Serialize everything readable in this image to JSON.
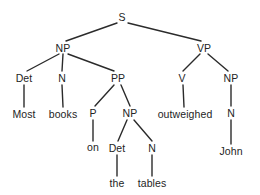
{
  "diagram": {
    "type": "constituency-parse-tree",
    "sentence": "Most books on the tables outweighed John",
    "colors": {
      "background": "#ffffff",
      "edge": "#2b2b2b",
      "text": "#242424"
    },
    "nodes": [
      {
        "id": "s",
        "label": "S",
        "kind": "nonterminal",
        "x": 122,
        "y": 17
      },
      {
        "id": "np1",
        "label": "NP",
        "kind": "nonterminal",
        "x": 63,
        "y": 48
      },
      {
        "id": "vp",
        "label": "VP",
        "kind": "nonterminal",
        "x": 204,
        "y": 48
      },
      {
        "id": "det1",
        "label": "Det",
        "kind": "nonterminal",
        "x": 24,
        "y": 78
      },
      {
        "id": "n1",
        "label": "N",
        "kind": "nonterminal",
        "x": 62,
        "y": 78
      },
      {
        "id": "pp",
        "label": "PP",
        "kind": "nonterminal",
        "x": 118,
        "y": 78
      },
      {
        "id": "v",
        "label": "V",
        "kind": "nonterminal",
        "x": 182,
        "y": 78
      },
      {
        "id": "np3",
        "label": "NP",
        "kind": "nonterminal",
        "x": 231,
        "y": 78
      },
      {
        "id": "w-most",
        "label": "Most",
        "kind": "terminal",
        "x": 24,
        "y": 114
      },
      {
        "id": "w-books",
        "label": "books",
        "kind": "terminal",
        "x": 63,
        "y": 114
      },
      {
        "id": "p",
        "label": "P",
        "kind": "nonterminal",
        "x": 93,
        "y": 113
      },
      {
        "id": "np2",
        "label": "NP",
        "kind": "nonterminal",
        "x": 130,
        "y": 113
      },
      {
        "id": "w-outweighed",
        "label": "outweighed",
        "kind": "terminal",
        "x": 185,
        "y": 114
      },
      {
        "id": "n3",
        "label": "N",
        "kind": "nonterminal",
        "x": 231,
        "y": 113
      },
      {
        "id": "w-on",
        "label": "on",
        "kind": "terminal",
        "x": 93,
        "y": 147
      },
      {
        "id": "det2",
        "label": "Det",
        "kind": "nonterminal",
        "x": 117,
        "y": 148
      },
      {
        "id": "n2",
        "label": "N",
        "kind": "nonterminal",
        "x": 152,
        "y": 148
      },
      {
        "id": "w-john",
        "label": "John",
        "kind": "terminal",
        "x": 231,
        "y": 151
      },
      {
        "id": "w-the",
        "label": "the",
        "kind": "terminal",
        "x": 117,
        "y": 183
      },
      {
        "id": "w-tables",
        "label": "tables",
        "kind": "terminal",
        "x": 152,
        "y": 183
      }
    ],
    "edges": [
      {
        "from": "s",
        "to": "np1",
        "x1": 117,
        "y1": 23,
        "x2": 66,
        "y2": 41
      },
      {
        "from": "s",
        "to": "vp",
        "x1": 128,
        "y1": 23,
        "x2": 201,
        "y2": 41
      },
      {
        "from": "np1",
        "to": "det1",
        "x1": 59,
        "y1": 54,
        "x2": 27,
        "y2": 71
      },
      {
        "from": "np1",
        "to": "n1",
        "x1": 63,
        "y1": 54,
        "x2": 62,
        "y2": 71
      },
      {
        "from": "np1",
        "to": "pp",
        "x1": 68,
        "y1": 54,
        "x2": 114,
        "y2": 71
      },
      {
        "from": "vp",
        "to": "v",
        "x1": 200,
        "y1": 54,
        "x2": 183,
        "y2": 71
      },
      {
        "from": "vp",
        "to": "np3",
        "x1": 208,
        "y1": 54,
        "x2": 228,
        "y2": 71
      },
      {
        "from": "det1",
        "to": "w-most",
        "x1": 24,
        "y1": 85,
        "x2": 24,
        "y2": 107
      },
      {
        "from": "n1",
        "to": "w-books",
        "x1": 62,
        "y1": 85,
        "x2": 63,
        "y2": 107
      },
      {
        "from": "pp",
        "to": "p",
        "x1": 114,
        "y1": 85,
        "x2": 95,
        "y2": 106
      },
      {
        "from": "pp",
        "to": "np2",
        "x1": 121,
        "y1": 85,
        "x2": 130,
        "y2": 106
      },
      {
        "from": "v",
        "to": "w-outweighed",
        "x1": 183,
        "y1": 85,
        "x2": 184,
        "y2": 107
      },
      {
        "from": "np3",
        "to": "n3",
        "x1": 231,
        "y1": 85,
        "x2": 231,
        "y2": 106
      },
      {
        "from": "p",
        "to": "w-on",
        "x1": 93,
        "y1": 120,
        "x2": 93,
        "y2": 141
      },
      {
        "from": "np2",
        "to": "det2",
        "x1": 127,
        "y1": 120,
        "x2": 118,
        "y2": 141
      },
      {
        "from": "np2",
        "to": "n2",
        "x1": 134,
        "y1": 120,
        "x2": 152,
        "y2": 141
      },
      {
        "from": "n3",
        "to": "w-john",
        "x1": 231,
        "y1": 120,
        "x2": 231,
        "y2": 144
      },
      {
        "from": "det2",
        "to": "w-the",
        "x1": 117,
        "y1": 155,
        "x2": 117,
        "y2": 176
      },
      {
        "from": "n2",
        "to": "w-tables",
        "x1": 152,
        "y1": 155,
        "x2": 152,
        "y2": 176
      }
    ]
  }
}
